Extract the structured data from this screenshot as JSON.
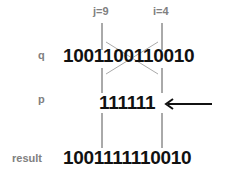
{
  "diagram": {
    "indices": {
      "j": "j=9",
      "i": "i=4"
    },
    "rows": {
      "q": {
        "label": "q",
        "bits": "1001100110010"
      },
      "p": {
        "label": "p",
        "bits": "111111"
      },
      "result": {
        "label": "result",
        "bits": "1001111110010"
      }
    },
    "colors": {
      "label": "#808080",
      "bits": "#111111",
      "line": "#555555",
      "cross": "#aaaaaa",
      "arrow": "#111111"
    }
  }
}
